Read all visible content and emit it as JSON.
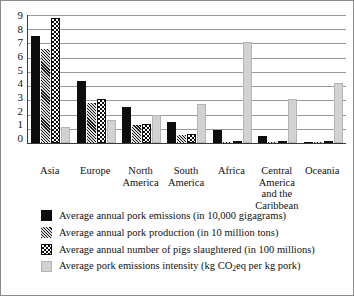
{
  "chart_data": {
    "type": "bar",
    "title": "",
    "xlabel": "",
    "ylabel": "",
    "ylim": [
      0,
      9
    ],
    "yticks": [
      "9",
      "8",
      "7",
      "6",
      "5",
      "4",
      "3",
      "2",
      "1",
      "0"
    ],
    "grid": true,
    "legend_position": "bottom",
    "categories": [
      "Asia",
      "Europe",
      "North America",
      "South America",
      "Africa",
      "Central America and the Caribbean",
      "Oceania"
    ],
    "series": [
      {
        "name": "Average annual pork emissions (in 10,000 gigagrams)",
        "pattern": "solid-black",
        "color": "#0d0d0d",
        "values": [
          7.5,
          4.35,
          2.5,
          1.5,
          0.9,
          0.5,
          0.1
        ]
      },
      {
        "name": "Average annual pork production (in 10 million tons)",
        "pattern": "diagonal-hatch",
        "color": "#5d5d5d",
        "values": [
          6.6,
          2.8,
          1.3,
          0.55,
          0.1,
          0.08,
          0.05
        ]
      },
      {
        "name": "Average annual number of pigs slaughtered (in 100 millions)",
        "pattern": "checkerboard",
        "color": "#0d0d0d",
        "values": [
          8.8,
          3.1,
          1.35,
          0.65,
          0.15,
          0.1,
          0.07
        ]
      },
      {
        "name": "Average pork emissions intensity (kg CO2eq per kg pork)",
        "pattern": "light-gray",
        "color": "#d2d2d2",
        "values": [
          1.15,
          1.6,
          2.0,
          2.75,
          7.1,
          3.1,
          4.2
        ]
      }
    ]
  },
  "legend": [
    {
      "pre": "Average annual pork emissions (in 10,000 gigagrams)",
      "sub": "",
      "post": ""
    },
    {
      "pre": "Average annual pork production (in 10 million tons)",
      "sub": "",
      "post": ""
    },
    {
      "pre": "Average annual number of pigs slaughtered (in 100 millions)",
      "sub": "",
      "post": ""
    },
    {
      "pre": "Average pork emissions intensity (kg CO",
      "sub": "2",
      "post": "eq per kg pork)"
    }
  ]
}
